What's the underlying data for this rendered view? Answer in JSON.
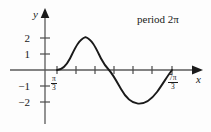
{
  "figure": {
    "annotation": "period 2π",
    "axes": {
      "x_label": "x",
      "y_label": "y"
    },
    "y_tick_labels": [
      "2",
      "1",
      "−1",
      "−2"
    ],
    "x_tick_labels": [
      {
        "numerator": "π",
        "denominator": "3"
      },
      {
        "numerator": "7π",
        "denominator": "3"
      }
    ]
  },
  "chart_data": {
    "type": "line",
    "title": "",
    "subtitle": "",
    "xlabel": "x",
    "ylabel": "y",
    "annotations": [
      "period 2π"
    ],
    "grid": false,
    "legend": null,
    "xlim": [
      -0.5236,
      3.1416
    ],
    "ylim": [
      -2.6,
      2.6
    ],
    "x_tick_labels": [
      "π/3",
      "7π/3"
    ],
    "y_tick_labels": [
      "2",
      "1",
      "−1",
      "−2"
    ],
    "y_ticks": [
      2,
      1,
      -1,
      -2
    ],
    "series": [
      {
        "name": "y = 2 sin(x − π/3)",
        "amplitude": 2,
        "period": "2π",
        "phase_shift": "π/3",
        "zeros": [
          "π/3",
          "4π/3",
          "7π/3"
        ],
        "maximum": {
          "x": "5π/6",
          "y": 2
        },
        "minimum": {
          "x": "11π/6",
          "y": -2
        },
        "path": "M 57,70 C 62,70 66.5,65.2 70,58.5 C 74.5,49.6 78.5,39.5 85.5,37.2 C 92.5,39.5 96.5,49.6 101,58.5 C 105,66 109,70 109,70 C 113,74.5 117,82 121,89 C 126,98 131,103 138,103.6 C 145,104.2 151,100 157,92 C 162.5,84.5 168,75 172,70"
      }
    ],
    "colors": {
      "curve": "#1a1a1a",
      "axis": "#4a4a4a",
      "background": "#fdfdfd"
    }
  }
}
